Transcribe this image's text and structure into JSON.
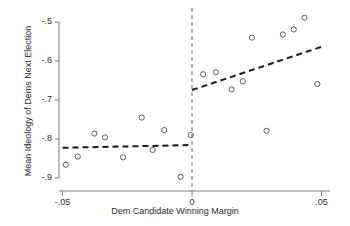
{
  "chart_data": {
    "type": "scatter",
    "title": "",
    "xlabel": "Dem Candidate Winning Margin",
    "ylabel": "Mean Ideology of Dems Next Election",
    "xlim": [
      -0.055,
      0.052
    ],
    "ylim": [
      -0.925,
      -0.478
    ],
    "xticks": [
      -0.05,
      0,
      0.05
    ],
    "xtick_labels": [
      "-.05",
      "0",
      ".05"
    ],
    "yticks": [
      -0.9,
      -0.8,
      -0.7,
      -0.6,
      -0.5
    ],
    "ytick_labels": [
      "-.9",
      "-.8",
      "-.7",
      "-.6",
      "-.5"
    ],
    "grid": false,
    "legend": null,
    "cutoff": 0,
    "cutoff_style": "dashed-vertical",
    "marker": "open-circle",
    "marker_color": "#5a5a5a",
    "line_color": "#1a1a1a",
    "axis_color": "#7a7a7a",
    "series": [
      {
        "name": "Binned means (left of cutoff)",
        "points": [
          {
            "x": -0.0487,
            "y": -0.866
          },
          {
            "x": -0.0441,
            "y": -0.845
          },
          {
            "x": -0.0377,
            "y": -0.786
          },
          {
            "x": -0.0336,
            "y": -0.796
          },
          {
            "x": -0.0266,
            "y": -0.847
          },
          {
            "x": -0.0194,
            "y": -0.745
          },
          {
            "x": -0.0152,
            "y": -0.828
          },
          {
            "x": -0.0107,
            "y": -0.777
          },
          {
            "x": -0.0044,
            "y": -0.897
          },
          {
            "x": -0.0005,
            "y": -0.79
          }
        ]
      },
      {
        "name": "Binned means (right of cutoff)",
        "points": [
          {
            "x": 0.0043,
            "y": -0.634
          },
          {
            "x": 0.0092,
            "y": -0.629
          },
          {
            "x": 0.0153,
            "y": -0.673
          },
          {
            "x": 0.0196,
            "y": -0.652
          },
          {
            "x": 0.0231,
            "y": -0.54
          },
          {
            "x": 0.0288,
            "y": -0.779
          },
          {
            "x": 0.0351,
            "y": -0.532
          },
          {
            "x": 0.0393,
            "y": -0.519
          },
          {
            "x": 0.0434,
            "y": -0.489
          },
          {
            "x": 0.0484,
            "y": -0.659
          }
        ]
      }
    ],
    "fit_lines": [
      {
        "name": "left-fit",
        "style": "dashed",
        "x0": -0.05,
        "y0": -0.8225,
        "x1": 0.0,
        "y1": -0.8155
      },
      {
        "name": "right-fit",
        "style": "dashed",
        "x0": 0.0,
        "y0": -0.6745,
        "x1": 0.05,
        "y1": -0.5635
      }
    ]
  }
}
